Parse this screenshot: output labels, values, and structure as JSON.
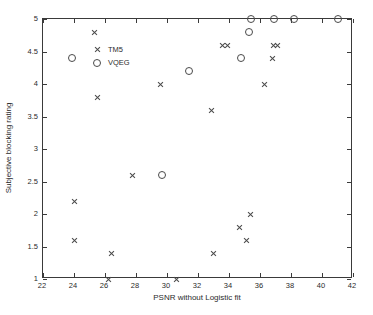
{
  "chart_data": {
    "type": "scatter",
    "title": "",
    "xlabel": "PSNR without Logistic fit",
    "ylabel": "Subjective blocking rating",
    "xlim": [
      22,
      42
    ],
    "ylim": [
      1,
      5
    ],
    "xticks": [
      22,
      24,
      26,
      28,
      30,
      32,
      34,
      36,
      38,
      40,
      42
    ],
    "yticks": [
      1,
      1.5,
      2,
      2.5,
      3,
      3.5,
      4,
      4.5,
      5
    ],
    "xticklabels": [
      "22",
      "24",
      "26",
      "28",
      "30",
      "32",
      "34",
      "36",
      "38",
      "40",
      "42"
    ],
    "yticklabels": [
      "1",
      "1.5",
      "2",
      "2.5",
      "3",
      "3.5",
      "4",
      "4.5",
      "5"
    ],
    "grid": false,
    "legend_position": "upper-left",
    "series": [
      {
        "name": "TM5",
        "marker": "x",
        "color": "#4a4a4a",
        "points": [
          [
            24.0,
            2.2
          ],
          [
            24.0,
            1.6
          ],
          [
            25.3,
            4.8
          ],
          [
            25.5,
            3.8
          ],
          [
            26.2,
            1.0
          ],
          [
            26.4,
            1.4
          ],
          [
            27.8,
            2.6
          ],
          [
            29.6,
            4.0
          ],
          [
            30.6,
            1.0
          ],
          [
            32.9,
            3.6
          ],
          [
            33.0,
            1.4
          ],
          [
            33.6,
            4.6
          ],
          [
            33.9,
            4.6
          ],
          [
            34.7,
            1.8
          ],
          [
            35.1,
            1.6
          ],
          [
            35.4,
            2.0
          ],
          [
            36.3,
            4.0
          ],
          [
            36.8,
            4.4
          ],
          [
            36.9,
            4.6
          ],
          [
            37.1,
            4.6
          ]
        ]
      },
      {
        "name": "VQEG",
        "marker": "o",
        "color": "#4a4a4a",
        "points": [
          [
            23.9,
            4.4
          ],
          [
            26.4,
            4.4
          ],
          [
            29.7,
            2.6
          ],
          [
            31.4,
            4.2
          ],
          [
            34.8,
            4.4
          ],
          [
            35.3,
            4.8
          ],
          [
            35.4,
            5.0
          ],
          [
            36.9,
            5.0
          ],
          [
            38.2,
            5.0
          ],
          [
            41.0,
            5.0
          ]
        ]
      }
    ]
  },
  "legend": {
    "items": [
      {
        "label": "TM5",
        "marker": "x"
      },
      {
        "label": "VQEG",
        "marker": "o"
      }
    ]
  }
}
